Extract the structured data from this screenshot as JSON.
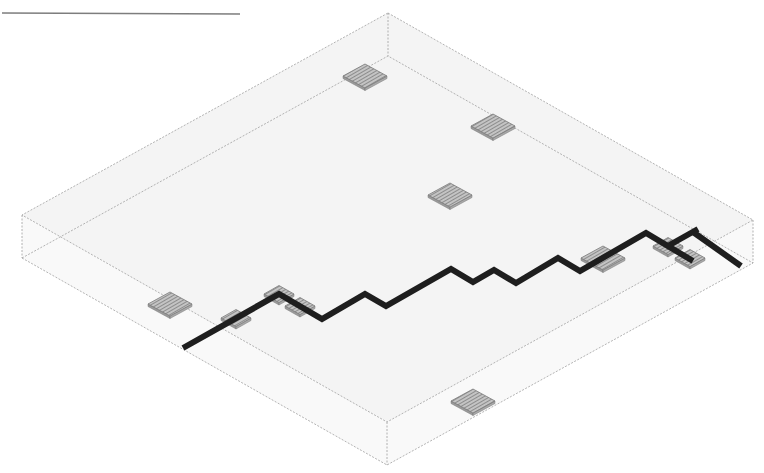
{
  "diagram": {
    "type": "isometric-slab-with-routing",
    "colors": {
      "background": "#ffffff",
      "slab_fill": "#f4f4f4",
      "slab_edge": "#a0a0a0",
      "pad_fill": "#bdbdbd",
      "pad_hatch": "#6a6a6a",
      "pad_edge": "#7a7a7a",
      "trace": "#1e1e1e",
      "header_rule": "#7d7d7d"
    },
    "header_rule": {
      "x1": 2,
      "y1": 13,
      "x2": 240,
      "y2": 14
    },
    "slab": {
      "top": [
        [
          388,
          13
        ],
        [
          753,
          220
        ],
        [
          387,
          422
        ],
        [
          22,
          215
        ]
      ],
      "bottom": [
        [
          388,
          56
        ],
        [
          753,
          263
        ],
        [
          387,
          465
        ],
        [
          22,
          258
        ]
      ],
      "thickness": 43
    },
    "pads": [
      {
        "id": "pad-1",
        "cx": 365,
        "cy": 76,
        "w": 44,
        "h": 24
      },
      {
        "id": "pad-2",
        "cx": 493,
        "cy": 126,
        "w": 44,
        "h": 24
      },
      {
        "id": "pad-3",
        "cx": 450,
        "cy": 195,
        "w": 44,
        "h": 24
      },
      {
        "id": "pad-4",
        "cx": 170,
        "cy": 304,
        "w": 44,
        "h": 24
      },
      {
        "id": "pad-5",
        "cx": 236,
        "cy": 318,
        "w": 30,
        "h": 17
      },
      {
        "id": "pad-6",
        "cx": 279,
        "cy": 294,
        "w": 30,
        "h": 17
      },
      {
        "id": "pad-7",
        "cx": 300,
        "cy": 306,
        "w": 30,
        "h": 17
      },
      {
        "id": "pad-8",
        "cx": 603,
        "cy": 258,
        "w": 44,
        "h": 24
      },
      {
        "id": "pad-9",
        "cx": 668,
        "cy": 246,
        "w": 30,
        "h": 17
      },
      {
        "id": "pad-10",
        "cx": 690,
        "cy": 258,
        "w": 30,
        "h": 17
      },
      {
        "id": "pad-11",
        "cx": 473,
        "cy": 401,
        "w": 44,
        "h": 24
      }
    ],
    "traces": [
      {
        "id": "trace-main",
        "width": 6,
        "points": [
          [
            183,
            348
          ],
          [
            279,
            294
          ],
          [
            322,
            319
          ],
          [
            365,
            294
          ],
          [
            386,
            306
          ],
          [
            451,
            269
          ],
          [
            473,
            282
          ],
          [
            494,
            270
          ],
          [
            516,
            283
          ],
          [
            558,
            258
          ],
          [
            580,
            271
          ],
          [
            646,
            233
          ],
          [
            693,
            261
          ]
        ]
      },
      {
        "id": "trace-branch-up",
        "width": 6,
        "points": [
          [
            666,
            247
          ],
          [
            698,
            229
          ]
        ]
      },
      {
        "id": "trace-branch-right",
        "width": 6,
        "points": [
          [
            693,
            232
          ],
          [
            741,
            266
          ]
        ]
      }
    ],
    "caption": "Isometric view of a slab with surface pads and a stepped conductive trace"
  }
}
